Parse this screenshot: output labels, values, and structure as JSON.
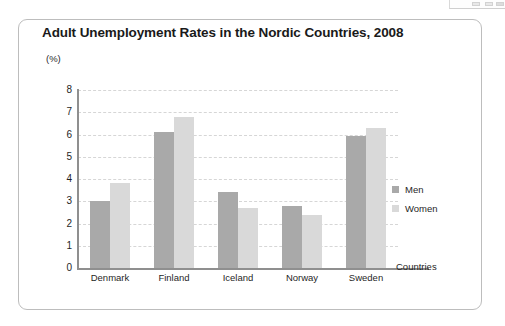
{
  "card": {
    "title": "Adult Unemployment Rates in the Nordic Countries, 2008"
  },
  "chart_data": {
    "type": "bar",
    "title": "Adult Unemployment Rates in the Nordic Countries, 2008",
    "categories": [
      "Denmark",
      "Finland",
      "Iceland",
      "Norway",
      "Sweden"
    ],
    "series": [
      {
        "name": "Men",
        "color": "#a9a9a9",
        "values": [
          3.0,
          6.1,
          3.4,
          2.8,
          5.95
        ]
      },
      {
        "name": "Women",
        "color": "#d9d9d9",
        "values": [
          3.8,
          6.8,
          2.7,
          2.4,
          6.3
        ]
      }
    ],
    "xlabel": "Countries",
    "ylabel": "(%)",
    "ylim": [
      0,
      8
    ],
    "yticks": [
      0,
      1,
      2,
      3,
      4,
      5,
      6,
      7,
      8
    ],
    "ytick_labels": [
      "0",
      "1",
      "2",
      "3",
      "4",
      "5",
      "6",
      "7",
      "8"
    ],
    "grid": true,
    "grid_style": "dashed-horizontal",
    "legend_position": "right"
  }
}
